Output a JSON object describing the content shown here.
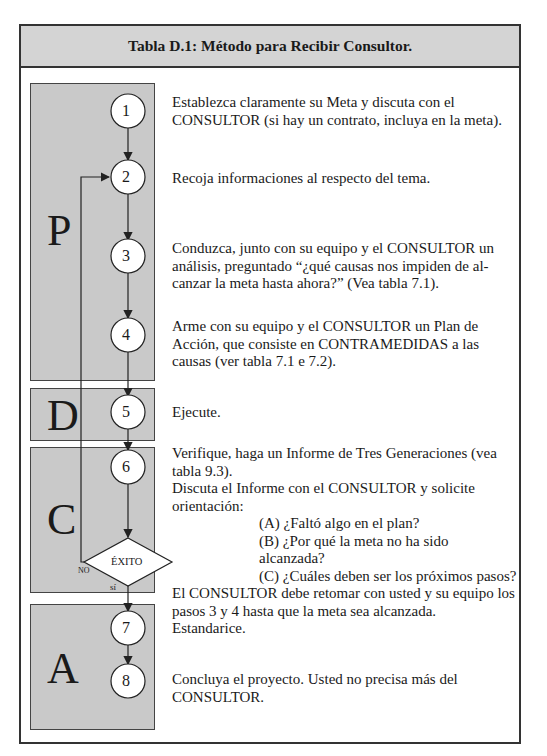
{
  "title": "Tabla D.1: Método para Recibir Consultor.",
  "phases": [
    {
      "letter": "P"
    },
    {
      "letter": "D"
    },
    {
      "letter": "C"
    },
    {
      "letter": "A"
    }
  ],
  "steps": [
    {
      "number": "1",
      "text": "Establezca claramente su Meta y discuta con el CONSULTOR (si hay un contrato, incluya en la meta)."
    },
    {
      "number": "2",
      "text": "Recoja informaciones al respecto del tema."
    },
    {
      "number": "3",
      "text": "Conduzca, junto con su equipo y el CONSULTOR un análisis, preguntado “¿qué causas nos impiden de al-canzar la meta hasta ahora?” (Vea tabla 7.1)."
    },
    {
      "number": "4",
      "text": "Arme con su equipo y el CONSULTOR un Plan de Acción, que consiste en CONTRAMEDIDAS a las causas (ver tabla 7.1 e 7.2)."
    },
    {
      "number": "5",
      "text": "Ejecute."
    },
    {
      "number": "6",
      "lines": [
        "Verifique, haga un Informe de Tres Generaciones (vea tabla 9.3).",
        "Discuta el Informe con el CONSULTOR y solicite orientación:"
      ],
      "questions": [
        "(A) ¿Faltó algo en el plan?",
        "(B) ¿Por qué la meta no ha sido alcanzada?",
        "(C) ¿Cuáles deben ser los próximos pasos?"
      ],
      "after": "El CONSULTOR debe retomar con usted y su equipo los pasos 3 y 4 hasta que la meta sea alcanzada."
    },
    {
      "number": "7",
      "text": "Estandarice."
    },
    {
      "number": "8",
      "text": "Concluya el proyecto. Usted no precisa más del CONSULTOR."
    }
  ],
  "decision": {
    "label": "ÉXITO",
    "no_label": "NO",
    "yes_label": "sí"
  }
}
